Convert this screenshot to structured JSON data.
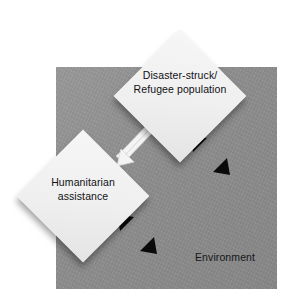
{
  "diagram": {
    "title_text": "",
    "environment": {
      "label": "Environment",
      "fill_color": "#8e8e8e",
      "text_color": "#16161a"
    },
    "nodes": [
      {
        "id": "disaster-struck-refugee-population",
        "label_line1": "Disaster-struck/",
        "label_line2": "Refugee population",
        "shape": "diamond",
        "fill_color": "#efefef",
        "text_color": "#101014"
      },
      {
        "id": "humanitarian-assistance",
        "label_line1": "Humanitarian",
        "label_line2": "assistance",
        "shape": "diamond",
        "fill_color": "#efefef",
        "text_color": "#101014"
      }
    ],
    "connectors": [
      {
        "id": "exchange-arrow",
        "name": "bidirectional-exchange-arrow",
        "style": "double-single-headed",
        "color": "#f2f2f2",
        "from": "humanitarian-assistance",
        "to": "disaster-struck-refugee-population",
        "orientation": "diagonal-ne-sw"
      },
      {
        "id": "population-environment-arrow",
        "name": "population-environment-arrow",
        "style": "double-headed",
        "color": "#0a0a0a",
        "from": "disaster-struck-refugee-population",
        "to": "environment",
        "orientation": "diagonal-nw-se"
      },
      {
        "id": "assistance-environment-arrow",
        "name": "assistance-environment-arrow",
        "style": "double-headed",
        "color": "#0a0a0a",
        "from": "humanitarian-assistance",
        "to": "environment",
        "orientation": "diagonal-nw-se"
      }
    ]
  }
}
